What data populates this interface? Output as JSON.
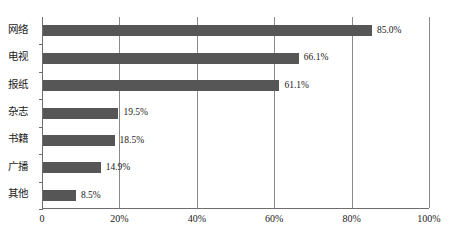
{
  "chart_data": {
    "type": "bar",
    "orientation": "horizontal",
    "title": "",
    "subtitle": "",
    "xlabel": "",
    "ylabel": "",
    "categories": [
      "网络",
      "电视",
      "报纸",
      "杂志",
      "书籍",
      "广播",
      "其他"
    ],
    "values": [
      85.0,
      66.1,
      61.1,
      19.5,
      18.5,
      14.9,
      8.5
    ],
    "data_labels": [
      "85.0%",
      "66.1%",
      "61.1%",
      "19.5%",
      "18.5%",
      "14.9%",
      "8.5%"
    ],
    "xlim": [
      0,
      100
    ],
    "x_tick_values": [
      0,
      20,
      40,
      60,
      80,
      100
    ],
    "x_tick_labels": [
      "0",
      "20%",
      "40%",
      "60%",
      "80%",
      "100%"
    ],
    "grid": "vertical",
    "legend": null,
    "series": [
      {
        "name": "",
        "values": [
          85.0,
          66.1,
          61.1,
          19.5,
          18.5,
          14.9,
          8.5
        ]
      }
    ],
    "colors": {
      "bar": "#565656",
      "axis": "#6e6e6e",
      "gridline": "#8a8a8a",
      "background": "#ffffff",
      "text": "#1a1a1a"
    }
  }
}
